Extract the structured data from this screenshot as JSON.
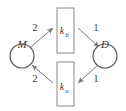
{
  "diagram": {
    "type": "cycle-diagram",
    "stroke_color": "#7a7a7a",
    "text_color": "#3a3a3a",
    "background_color": "#ffffff",
    "places": [
      {
        "id": "M",
        "label": "M",
        "shape": "circle",
        "position": "left"
      },
      {
        "id": "D",
        "label": "D",
        "shape": "circle",
        "position": "right"
      }
    ],
    "transitions": [
      {
        "id": "kb",
        "label_base": "k",
        "label_sub": "b",
        "shape": "rectangle",
        "position": "top"
      },
      {
        "id": "ku",
        "label_base": "k",
        "label_sub": "u",
        "shape": "rectangle",
        "position": "bottom"
      }
    ],
    "edges": [
      {
        "id": "M-to-kb",
        "from": "M",
        "to": "kb",
        "weight": "2",
        "direction": "up-right"
      },
      {
        "id": "kb-to-D",
        "from": "kb",
        "to": "D",
        "weight": "1",
        "direction": "down-right"
      },
      {
        "id": "D-to-ku",
        "from": "D",
        "to": "ku",
        "weight": "1",
        "direction": "down-left"
      },
      {
        "id": "ku-to-M",
        "from": "ku",
        "to": "M",
        "weight": "2",
        "direction": "up-left"
      }
    ]
  }
}
